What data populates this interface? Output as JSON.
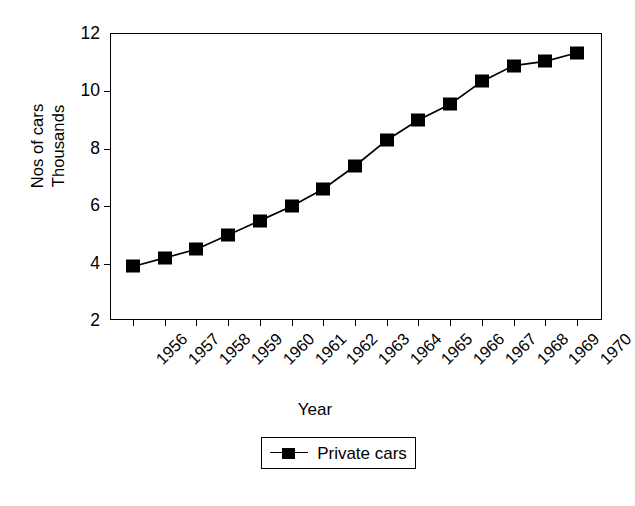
{
  "chart_data": {
    "type": "line",
    "title": "",
    "xlabel": "Year",
    "ylabel": "Nos of cars Thousands",
    "ylabel_lines": [
      "Nos of cars",
      "Thousands"
    ],
    "categories": [
      "1956",
      "1957",
      "1958",
      "1959",
      "1960",
      "1961",
      "1962",
      "1963",
      "1964",
      "1965",
      "1966",
      "1967",
      "1968",
      "1969",
      "1970"
    ],
    "series": [
      {
        "name": "Private cars",
        "marker": "filled-square",
        "color": "#000000",
        "values": [
          3.9,
          4.2,
          4.5,
          5.0,
          5.5,
          6.0,
          6.6,
          7.4,
          8.3,
          9.0,
          9.55,
          10.35,
          10.9,
          11.05,
          11.35
        ]
      }
    ],
    "ylim": [
      2,
      12
    ],
    "yticks": [
      2,
      4,
      6,
      8,
      10,
      12
    ],
    "ytick_labels": [
      "2",
      "4",
      "6",
      "8",
      "10",
      "12"
    ],
    "grid": false,
    "legend_position": "bottom-center",
    "legend_entries": [
      "Private cars"
    ],
    "x_tick_label_rotation": -45
  },
  "axes": {
    "y_title_line1": "Nos of cars",
    "y_title_line2": "Thousands",
    "x_title": "Year"
  },
  "legend": {
    "entry_label": "Private cars"
  }
}
